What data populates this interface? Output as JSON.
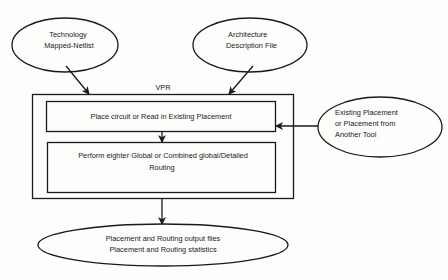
{
  "diagram": {
    "title": "VPR",
    "inputs": {
      "technology": {
        "lines": [
          "Technology",
          "Mapped-Netlist"
        ]
      },
      "architecture": {
        "lines": [
          "Architecture",
          "Description File"
        ]
      },
      "existing_placement": {
        "lines": [
          "Existing Placement",
          "or Placement from",
          "Another Tool"
        ]
      }
    },
    "steps": [
      {
        "lines": [
          "Place circuit or Read in Existing Placement"
        ]
      },
      {
        "lines": [
          "Perform eighter Global or Combined global/Detailed",
          "Routing"
        ]
      }
    ],
    "output": {
      "lines": [
        "Placement and Routing output files",
        "Placement and Routing statistics"
      ]
    },
    "colors": {
      "stroke": "#1a1a1a",
      "background": "#fdfdfc",
      "text": "#1a1a1a"
    }
  }
}
